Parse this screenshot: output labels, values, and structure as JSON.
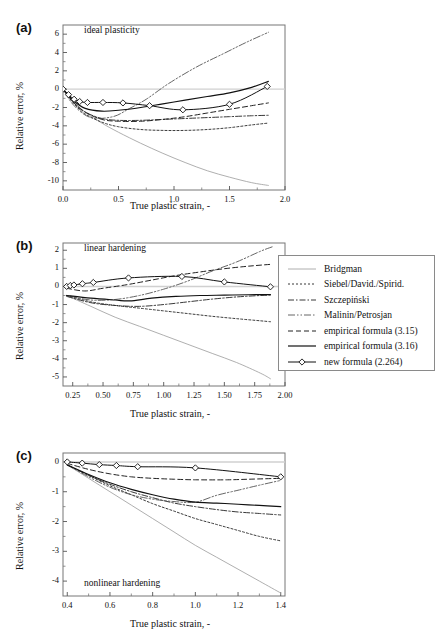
{
  "figure": {
    "axis_title_x": "True plastic strain, -",
    "axis_title_y": "Relative error, %"
  },
  "panels": [
    {
      "label": "(a)",
      "title": "ideal plasticity"
    },
    {
      "label": "(b)",
      "title": "linear hardening"
    },
    {
      "label": "(c)",
      "title": "nonlinear hardening"
    }
  ],
  "legend": {
    "items": [
      {
        "label": "Bridgman",
        "style": "thin-solid-gray",
        "color": "#9a9a9a"
      },
      {
        "label": "Siebel/David./Spirid.",
        "style": "dotted",
        "color": "#222222"
      },
      {
        "label": "Szczepiński",
        "style": "dash-dot",
        "color": "#222222"
      },
      {
        "label": "Malinin/Petrosjan",
        "style": "dash-dot-dot",
        "color": "#222222"
      },
      {
        "label": "empirical formula (3.15)",
        "style": "dashed",
        "color": "#222222"
      },
      {
        "label": "empirical formula (3.16)",
        "style": "solid-bold",
        "color": "#111111"
      },
      {
        "label": "new formula (2.264)",
        "style": "solid-marker-diamond",
        "color": "#111111"
      }
    ]
  },
  "chart_data": [
    {
      "type": "line",
      "title": "ideal plasticity",
      "panel": "(a)",
      "xlabel": "True plastic strain, -",
      "ylabel": "Relative error, %",
      "xlim": [
        0.0,
        2.0
      ],
      "ylim": [
        -11.0,
        7.0
      ],
      "xticks": [
        "0.0",
        "0.5",
        "1.0",
        "1.5",
        "2.0"
      ],
      "xtick_values": [
        0.0,
        0.5,
        1.0,
        1.5,
        2.0
      ],
      "yticks": [
        "6",
        "4",
        "2",
        "0",
        "-2",
        "-4",
        "-6",
        "-8",
        "-10"
      ],
      "ytick_values": [
        6,
        4,
        2,
        0,
        -2,
        -4,
        -6,
        -8,
        -10
      ],
      "grid": false,
      "legend_position": "external-right",
      "series": [
        {
          "name": "Bridgman",
          "x": [
            0.0,
            0.1,
            0.2,
            0.35,
            0.5,
            0.7,
            0.9,
            1.1,
            1.3,
            1.5,
            1.7,
            1.85
          ],
          "y": [
            0.0,
            -1.4,
            -2.5,
            -3.7,
            -4.7,
            -5.9,
            -7.0,
            -8.0,
            -8.9,
            -9.6,
            -10.2,
            -10.5
          ]
        },
        {
          "name": "Siebel/David./Spirid.",
          "x": [
            0.0,
            0.1,
            0.2,
            0.35,
            0.5,
            0.7,
            0.9,
            1.1,
            1.3,
            1.5,
            1.7,
            1.85
          ],
          "y": [
            0.0,
            -1.6,
            -2.7,
            -3.6,
            -4.1,
            -4.4,
            -4.5,
            -4.5,
            -4.4,
            -4.2,
            -3.9,
            -3.7
          ]
        },
        {
          "name": "Szczepiński",
          "x": [
            0.0,
            0.1,
            0.2,
            0.35,
            0.5,
            0.7,
            0.9,
            1.1,
            1.3,
            1.5,
            1.7,
            1.85
          ],
          "y": [
            0.0,
            -1.5,
            -2.5,
            -3.2,
            -3.4,
            -3.4,
            -3.3,
            -3.2,
            -3.1,
            -3.0,
            -2.9,
            -2.85
          ]
        },
        {
          "name": "Malinin/Petrosjan",
          "x": [
            0.0,
            0.1,
            0.25,
            0.45,
            0.6,
            0.75,
            0.95,
            1.2,
            1.45,
            1.65,
            1.85
          ],
          "y": [
            0.0,
            -1.8,
            -3.1,
            -3.0,
            -2.1,
            -1.1,
            0.6,
            2.4,
            3.9,
            5.1,
            6.2
          ]
        },
        {
          "name": "empirical formula (3.15)",
          "x": [
            0.0,
            0.1,
            0.2,
            0.35,
            0.5,
            0.7,
            0.9,
            1.1,
            1.3,
            1.5,
            1.7,
            1.85
          ],
          "y": [
            0.0,
            -1.5,
            -2.5,
            -3.3,
            -3.5,
            -3.5,
            -3.3,
            -3.0,
            -2.6,
            -2.2,
            -1.8,
            -1.5
          ]
        },
        {
          "name": "empirical formula (3.16)",
          "x": [
            0.0,
            0.1,
            0.2,
            0.35,
            0.5,
            0.7,
            0.9,
            1.1,
            1.3,
            1.5,
            1.7,
            1.85
          ],
          "y": [
            0.0,
            -1.3,
            -2.1,
            -2.4,
            -2.3,
            -2.0,
            -1.6,
            -1.2,
            -0.8,
            -0.4,
            0.2,
            0.85
          ]
        },
        {
          "name": "new formula (2.264)",
          "x": [
            0.0,
            0.05,
            0.1,
            0.15,
            0.22,
            0.36,
            0.54,
            0.78,
            1.08,
            1.5,
            1.84
          ],
          "y": [
            0.0,
            -0.6,
            -1.1,
            -1.35,
            -1.45,
            -1.45,
            -1.5,
            -1.8,
            -2.25,
            -1.65,
            0.3
          ],
          "markers": "diamond"
        }
      ]
    },
    {
      "type": "line",
      "title": "linear hardening",
      "panel": "(b)",
      "xlabel": "True plastic strain, -",
      "ylabel": "Relative error, %",
      "xlim": [
        0.17,
        2.0
      ],
      "ylim": [
        -5.5,
        2.4
      ],
      "xticks": [
        "0.25",
        "0.50",
        "0.75",
        "1.00",
        "1.25",
        "1.50",
        "1.75",
        "2.00"
      ],
      "xtick_values": [
        0.25,
        0.5,
        0.75,
        1.0,
        1.25,
        1.5,
        1.75,
        2.0
      ],
      "yticks": [
        "2",
        "1",
        "0",
        "-1",
        "-2",
        "-3",
        "-4",
        "-5"
      ],
      "ytick_values": [
        2,
        1,
        0,
        -1,
        -2,
        -3,
        -4,
        -5
      ],
      "grid": false,
      "legend_position": "external-right",
      "series": [
        {
          "name": "Bridgman",
          "x": [
            0.2,
            0.4,
            0.6,
            0.8,
            1.0,
            1.2,
            1.4,
            1.6,
            1.8,
            1.88
          ],
          "y": [
            -0.5,
            -1.1,
            -1.7,
            -2.2,
            -2.7,
            -3.2,
            -3.7,
            -4.2,
            -4.8,
            -5.1
          ]
        },
        {
          "name": "Siebel/David./Spirid.",
          "x": [
            0.2,
            0.4,
            0.6,
            0.8,
            1.0,
            1.2,
            1.4,
            1.6,
            1.8,
            1.88
          ],
          "y": [
            -0.5,
            -0.85,
            -1.05,
            -1.2,
            -1.35,
            -1.5,
            -1.65,
            -1.78,
            -1.9,
            -1.95
          ]
        },
        {
          "name": "Szczepiński",
          "x": [
            0.2,
            0.4,
            0.6,
            0.8,
            1.0,
            1.2,
            1.4,
            1.6,
            1.8,
            1.88
          ],
          "y": [
            -0.55,
            -0.9,
            -1.05,
            -1.1,
            -1.0,
            -0.85,
            -0.7,
            -0.58,
            -0.5,
            -0.48
          ]
        },
        {
          "name": "Malinin/Petrosjan",
          "x": [
            0.2,
            0.4,
            0.6,
            0.8,
            1.0,
            1.2,
            1.4,
            1.6,
            1.8,
            1.9
          ],
          "y": [
            -0.5,
            -0.75,
            -0.72,
            -0.5,
            -0.15,
            0.3,
            0.85,
            1.35,
            1.95,
            2.2
          ]
        },
        {
          "name": "empirical formula (3.15)",
          "x": [
            0.2,
            0.35,
            0.5,
            0.7,
            0.9,
            1.1,
            1.3,
            1.5,
            1.7,
            1.88
          ],
          "y": [
            -0.1,
            -0.25,
            -0.1,
            0.1,
            0.35,
            0.6,
            0.8,
            0.98,
            1.12,
            1.22
          ]
        },
        {
          "name": "empirical formula (3.16)",
          "x": [
            0.2,
            0.4,
            0.6,
            0.72,
            0.9,
            1.1,
            1.3,
            1.5,
            1.7,
            1.88
          ],
          "y": [
            -0.5,
            -0.65,
            -0.75,
            -0.8,
            -0.65,
            -0.55,
            -0.5,
            -0.48,
            -0.46,
            -0.45
          ]
        },
        {
          "name": "new formula (2.264)",
          "x": [
            0.2,
            0.23,
            0.26,
            0.33,
            0.42,
            0.71,
            1.15,
            1.5,
            1.88
          ],
          "y": [
            0.0,
            0.05,
            0.08,
            0.15,
            0.22,
            0.47,
            0.55,
            0.25,
            -0.02
          ],
          "markers": "diamond"
        }
      ]
    },
    {
      "type": "line",
      "title": "nonlinear hardening",
      "panel": "(c)",
      "xlabel": "True plastic strain, -",
      "ylabel": "Relative error, %",
      "xlim": [
        0.38,
        1.42
      ],
      "ylim": [
        -4.5,
        0.3
      ],
      "xticks": [
        "0.4",
        "0.6",
        "0.8",
        "1.0",
        "1.2",
        "1.4"
      ],
      "xtick_values": [
        0.4,
        0.6,
        0.8,
        1.0,
        1.2,
        1.4
      ],
      "yticks": [
        "0",
        "-1",
        "-2",
        "-3",
        "-4"
      ],
      "ytick_values": [
        0,
        -1,
        -2,
        -3,
        -4
      ],
      "grid": false,
      "legend_position": "external-right",
      "series": [
        {
          "name": "Bridgman",
          "x": [
            0.4,
            0.5,
            0.6,
            0.7,
            0.8,
            0.9,
            1.0,
            1.1,
            1.2,
            1.3,
            1.4
          ],
          "y": [
            -0.1,
            -0.55,
            -1.0,
            -1.45,
            -1.9,
            -2.35,
            -2.8,
            -3.2,
            -3.6,
            -4.0,
            -4.4
          ]
        },
        {
          "name": "Siebel/David./Spirid.",
          "x": [
            0.4,
            0.5,
            0.6,
            0.7,
            0.8,
            0.9,
            1.0,
            1.1,
            1.2,
            1.3,
            1.4
          ],
          "y": [
            -0.1,
            -0.45,
            -0.8,
            -1.1,
            -1.4,
            -1.65,
            -1.9,
            -2.1,
            -2.3,
            -2.5,
            -2.65
          ]
        },
        {
          "name": "Szczepiński",
          "x": [
            0.4,
            0.5,
            0.6,
            0.7,
            0.8,
            0.9,
            1.0,
            1.1,
            1.2,
            1.3,
            1.4
          ],
          "y": [
            -0.1,
            -0.45,
            -0.75,
            -1.0,
            -1.2,
            -1.38,
            -1.5,
            -1.6,
            -1.68,
            -1.73,
            -1.78
          ]
        },
        {
          "name": "Malinin/Petrosjan",
          "x": [
            0.4,
            0.5,
            0.6,
            0.7,
            0.8,
            0.9,
            1.0,
            1.1,
            1.2,
            1.3,
            1.4
          ],
          "y": [
            -0.1,
            -0.5,
            -0.85,
            -1.1,
            -1.25,
            -1.33,
            -1.35,
            -1.12,
            -0.95,
            -0.78,
            -0.62
          ]
        },
        {
          "name": "empirical formula (3.15)",
          "x": [
            0.4,
            0.5,
            0.6,
            0.7,
            0.8,
            0.9,
            1.0,
            1.15,
            1.25,
            1.4
          ],
          "y": [
            -0.05,
            -0.25,
            -0.4,
            -0.5,
            -0.55,
            -0.58,
            -0.6,
            -0.6,
            -0.58,
            -0.55
          ]
        },
        {
          "name": "empirical formula (3.16)",
          "x": [
            0.4,
            0.5,
            0.6,
            0.7,
            0.8,
            0.9,
            1.0,
            1.1,
            1.2,
            1.3,
            1.4
          ],
          "y": [
            -0.1,
            -0.42,
            -0.7,
            -0.92,
            -1.1,
            -1.25,
            -1.35,
            -1.38,
            -1.42,
            -1.46,
            -1.5
          ]
        },
        {
          "name": "new formula (2.264)",
          "x": [
            0.4,
            0.47,
            0.55,
            0.63,
            0.73,
            1.0,
            1.4
          ],
          "y": [
            0.0,
            -0.04,
            -0.09,
            -0.12,
            -0.16,
            -0.2,
            -0.5
          ],
          "markers": "diamond"
        }
      ]
    }
  ]
}
